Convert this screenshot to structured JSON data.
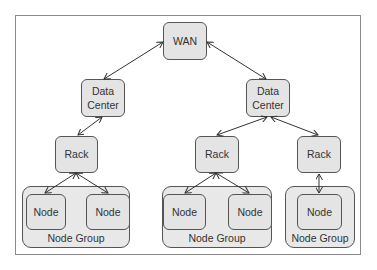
{
  "diagram": {
    "wan": {
      "label": "WAN"
    },
    "data_centers": [
      {
        "label": "Data\nCenter"
      },
      {
        "label": "Data\nCenter"
      }
    ],
    "racks": [
      {
        "label": "Rack"
      },
      {
        "label": "Rack"
      },
      {
        "label": "Rack"
      }
    ],
    "node_groups": [
      {
        "label": "Node Group",
        "nodes": [
          "Node",
          "Node"
        ]
      },
      {
        "label": "Node Group",
        "nodes": [
          "Node",
          "Node"
        ]
      },
      {
        "label": "Node Group",
        "nodes": [
          "Node"
        ]
      }
    ],
    "connections": [
      [
        "WAN",
        "Data Center 1"
      ],
      [
        "WAN",
        "Data Center 2"
      ],
      [
        "Data Center 1",
        "Rack 1"
      ],
      [
        "Data Center 2",
        "Rack 2"
      ],
      [
        "Data Center 2",
        "Rack 3"
      ],
      [
        "Rack 1",
        "Node 1"
      ],
      [
        "Rack 1",
        "Node 2"
      ],
      [
        "Rack 2",
        "Node 3"
      ],
      [
        "Rack 2",
        "Node 4"
      ],
      [
        "Rack 3",
        "Node 5"
      ]
    ],
    "colors": {
      "box_fill": "#e4e4e4",
      "border": "#555555",
      "frame": "#8a8a8a"
    }
  }
}
